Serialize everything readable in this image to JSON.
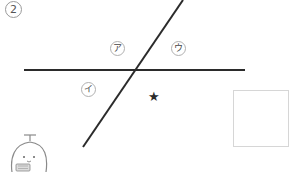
{
  "problem": {
    "number": "2",
    "number_display": "②"
  },
  "labels": {
    "a": "ア",
    "i": "イ",
    "u": "ウ"
  },
  "marks": {
    "star": "★"
  },
  "answer_box": {
    "value": ""
  },
  "lines": {
    "horizontal": {
      "x1": 24,
      "y1": 70,
      "x2": 245,
      "y2": 70
    },
    "diagonal": {
      "x1": 183,
      "y1": 0,
      "x2": 83,
      "y2": 147
    }
  },
  "colors": {
    "line": "#2b2b2b",
    "label_border": "#b0b0b0",
    "box_border": "#d6d6d6",
    "mascot_stroke": "#8a8a8a"
  },
  "mascot": {
    "name": "mascot-character"
  }
}
